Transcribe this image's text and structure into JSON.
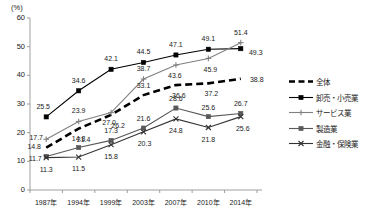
{
  "chart_data": {
    "type": "line",
    "title": "",
    "subtitle": "",
    "xlabel": "",
    "ylabel": "",
    "unit_label": "(%)",
    "categories": [
      "1987年",
      "1994年",
      "1999年",
      "2003年",
      "2007年",
      "2010年",
      "2014年"
    ],
    "ylim": [
      0,
      60
    ],
    "yticks": [
      0,
      10,
      20,
      30,
      40,
      50,
      60
    ],
    "ytick_labels": [
      "0",
      "10",
      "20",
      "30",
      "40",
      "50",
      "60"
    ],
    "grid": false,
    "legend_position": "right",
    "series": [
      {
        "name": "全体",
        "marker": "none",
        "dash": true,
        "color": "#000000",
        "values": [
          14.8,
          21.4,
          26.2,
          33.1,
          36.6,
          37.2,
          38.8
        ]
      },
      {
        "name": "卸売・小売業",
        "marker": "square",
        "dash": false,
        "color": "#000000",
        "values": [
          25.5,
          34.6,
          42.1,
          44.5,
          47.1,
          49.1,
          49.3
        ]
      },
      {
        "name": "サービス業",
        "marker": "plus",
        "dash": false,
        "color": "#808080",
        "values": [
          17.7,
          23.9,
          27.0,
          38.7,
          43.6,
          45.9,
          51.4
        ]
      },
      {
        "name": "製造業",
        "marker": "square",
        "dash": false,
        "color": "#595959",
        "values": [
          11.7,
          14.8,
          17.3,
          21.6,
          28.6,
          25.6,
          26.7
        ]
      },
      {
        "name": "金融・保険業",
        "marker": "cross",
        "dash": false,
        "color": "#333333",
        "values": [
          11.3,
          11.5,
          15.8,
          20.3,
          24.8,
          21.8,
          25.6
        ]
      }
    ],
    "data_labels": [
      {
        "series": "卸売・小売業",
        "index": 0,
        "text": "25.5"
      },
      {
        "series": "卸売・小売業",
        "index": 1,
        "text": "34.6"
      },
      {
        "series": "卸売・小売業",
        "index": 2,
        "text": "42.1"
      },
      {
        "series": "卸売・小売業",
        "index": 3,
        "text": "44.5"
      },
      {
        "series": "卸売・小売業",
        "index": 4,
        "text": "47.1"
      },
      {
        "series": "卸売・小売業",
        "index": 5,
        "text": "49.1"
      },
      {
        "series": "卸売・小売業",
        "index": 6,
        "text": "49.3"
      },
      {
        "series": "サービス業",
        "index": 0,
        "text": "17.7"
      },
      {
        "series": "サービス業",
        "index": 1,
        "text": "23.9"
      },
      {
        "series": "サービス業",
        "index": 2,
        "text": "27.0"
      },
      {
        "series": "サービス業",
        "index": 3,
        "text": "38.7"
      },
      {
        "series": "サービス業",
        "index": 4,
        "text": "43.6"
      },
      {
        "series": "サービス業",
        "index": 5,
        "text": "45.9"
      },
      {
        "series": "サービス業",
        "index": 6,
        "text": "51.4"
      },
      {
        "series": "全体",
        "index": 0,
        "text": "14.8"
      },
      {
        "series": "全体",
        "index": 1,
        "text": "21.4"
      },
      {
        "series": "全体",
        "index": 2,
        "text": "26.2"
      },
      {
        "series": "全体",
        "index": 3,
        "text": "33.1"
      },
      {
        "series": "全体",
        "index": 4,
        "text": "36.6"
      },
      {
        "series": "全体",
        "index": 5,
        "text": "37.2"
      },
      {
        "series": "全体",
        "index": 6,
        "text": "38.8"
      },
      {
        "series": "製造業",
        "index": 0,
        "text": "11.7"
      },
      {
        "series": "製造業",
        "index": 1,
        "text": "14.8"
      },
      {
        "series": "製造業",
        "index": 2,
        "text": "17.3"
      },
      {
        "series": "製造業",
        "index": 3,
        "text": "21.6"
      },
      {
        "series": "製造業",
        "index": 4,
        "text": "28.6"
      },
      {
        "series": "製造業",
        "index": 5,
        "text": "25.6"
      },
      {
        "series": "製造業",
        "index": 6,
        "text": "26.7"
      },
      {
        "series": "金融・保険業",
        "index": 0,
        "text": "11.3"
      },
      {
        "series": "金融・保険業",
        "index": 1,
        "text": "11.5"
      },
      {
        "series": "金融・保険業",
        "index": 2,
        "text": "15.8"
      },
      {
        "series": "金融・保険業",
        "index": 3,
        "text": "20.3"
      },
      {
        "series": "金融・保険業",
        "index": 4,
        "text": "24.8"
      },
      {
        "series": "金融・保険業",
        "index": 5,
        "text": "21.8"
      },
      {
        "series": "金融・保険業",
        "index": 6,
        "text": "25.6"
      }
    ]
  }
}
